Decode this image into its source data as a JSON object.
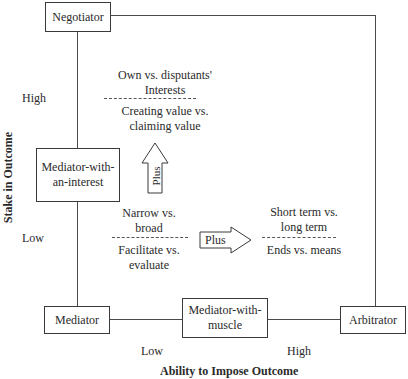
{
  "roles": {
    "negotiator": "Negotiator",
    "mediator_interest_line1": "Mediator-with-",
    "mediator_interest_line2": "an-interest",
    "mediator": "Mediator",
    "mediator_muscle_line1": "Mediator-with-",
    "mediator_muscle_line2": "muscle",
    "arbitrator": "Arbitrator"
  },
  "axes": {
    "y_label": "Stake in Outcome",
    "y_high": "High",
    "y_low": "Low",
    "x_label": "Ability to Impose Outcome",
    "x_low": "Low",
    "x_high": "High"
  },
  "dimensions": {
    "top_group": {
      "line1": "Own vs. disputants'",
      "line2": "Interests",
      "line3": "Creating value vs.",
      "line4": "claiming value"
    },
    "middle_group": {
      "line1": "Narrow vs.",
      "line2": "broad",
      "line3": "Facilitate vs.",
      "line4": "evaluate"
    },
    "right_group": {
      "line1": "Short term vs.",
      "line2": "long term",
      "line3": "Ends vs. means"
    }
  },
  "arrows": {
    "up_label": "Plus",
    "right_label": "Plus"
  }
}
